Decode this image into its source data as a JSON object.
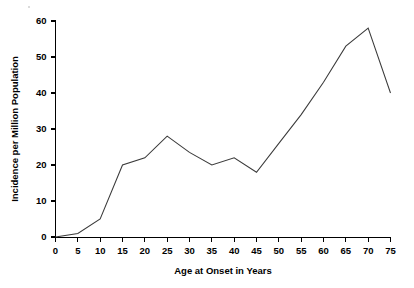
{
  "chart_data": {
    "type": "line",
    "title": "",
    "subtitle": "",
    "xlabel": "Age at Onset in Years",
    "ylabel": "Incidence per Million Population",
    "x": [
      0,
      5,
      10,
      15,
      20,
      25,
      30,
      35,
      40,
      45,
      50,
      55,
      60,
      65,
      70,
      75
    ],
    "values": [
      0,
      1,
      5,
      20,
      22,
      28,
      23.5,
      20,
      22,
      18,
      26,
      34,
      43,
      53,
      58,
      40
    ],
    "series": [
      {
        "name": "Incidence",
        "values": [
          0,
          1,
          5,
          20,
          22,
          28,
          23.5,
          20,
          22,
          18,
          26,
          34,
          43,
          53,
          58,
          40
        ]
      }
    ],
    "xlim": [
      0,
      75
    ],
    "ylim": [
      0,
      60
    ],
    "xticks": [
      0,
      5,
      10,
      15,
      20,
      25,
      30,
      35,
      40,
      45,
      50,
      55,
      60,
      65,
      70,
      75
    ],
    "yticks": [
      0,
      10,
      20,
      30,
      40,
      50,
      60
    ],
    "xtick_labels": [
      "0",
      "5",
      "10",
      "15",
      "20",
      "25",
      "30",
      "35",
      "40",
      "45",
      "50",
      "55",
      "60",
      "65",
      "70",
      "75"
    ],
    "ytick_labels": [
      "0",
      "10",
      "20",
      "30",
      "40",
      "50",
      "60"
    ],
    "grid": false,
    "legend": false,
    "legend_position": "none",
    "line_color": "#3a3a3a",
    "axis_color": "#000000",
    "background_color": "#ffffff"
  }
}
